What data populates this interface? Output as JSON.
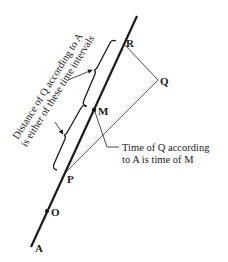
{
  "diagram": {
    "colors": {
      "ink": "#1a1a1a",
      "background": "#ffffff"
    },
    "worldline": {
      "name": "A",
      "label": "A"
    },
    "points": {
      "O": {
        "label": "O"
      },
      "P": {
        "label": "P"
      },
      "M": {
        "label": "M"
      },
      "R": {
        "label": "R"
      },
      "Q": {
        "label": "Q"
      }
    },
    "annotations": {
      "distance_line1": "Distance of Q according to A",
      "distance_line2": "is either of these time intervals",
      "time_line1": "Time of Q according",
      "time_line2": "to A is time of M"
    }
  }
}
